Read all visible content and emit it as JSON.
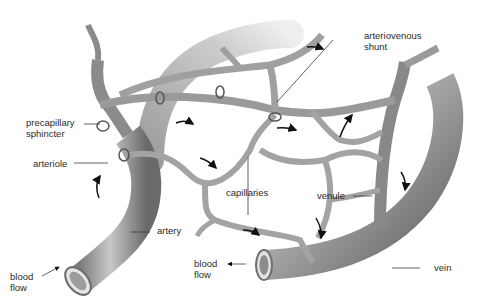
{
  "diagram": {
    "labels": {
      "precapillary_line1": "precapillary",
      "precapillary_line2": "sphincter",
      "arteriole": "arteriole",
      "arteriovenous_line1": "arteriovenous",
      "arteriovenous_line2": "shunt",
      "capillaries": "capillaries",
      "venule": "venule",
      "artery": "artery",
      "vein": "vein",
      "blood_flow_left_1": "blood",
      "blood_flow_left_2": "flow",
      "blood_flow_right_1": "blood",
      "blood_flow_right_2": "flow"
    },
    "colors": {
      "vessel_dark": "#6e6e6e",
      "vessel_mid": "#9a9a9a",
      "vessel_light": "#cfcfcf",
      "text": "#2b2b2b",
      "leader": "#3a3a3a"
    }
  }
}
